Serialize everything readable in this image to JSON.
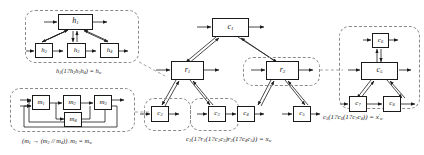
{
  "diagram": {
    "background_color": "#ffffff",
    "line_color": "#1a1a1a",
    "group_border_color": "#8a8a8a",
    "groups": [
      {
        "id": "group-h",
        "caption_html": "h<sub>1</sub>(1?h<sub>2</sub>h<sub>3</sub>h<sub>4</sub>) = h<sub>w</sub>",
        "caption_plain": "h1(1?h2h3h4) = hw"
      },
      {
        "id": "group-m",
        "caption_html": "(m<sub>1</sub> &#8594; (m<sub>2</sub> // m<sub>4</sub>))<sub>+</sub>m<sub>3</sub> = m<sub>w</sub>",
        "caption_plain": "(m1 -> (m2 // m4))+m3 = mw"
      },
      {
        "id": "group-center",
        "caption_html": "c<sub>1</sub>(1?r<sub>1</sub>(1?c<sub>2</sub>c<sub>3</sub>)r<sub>2</sub>(1?c<sub>4</sub>c<sub>5</sub>)) = x<sub>w</sub>",
        "caption_plain": "c1(1?r1(1?c2c3)r2(1?c4c5)) = xw"
      },
      {
        "id": "group-right",
        "caption_html": "c<sub>5</sub>(1?c<sub>6</sub>(1?c<sub>7</sub>c<sub>8</sub>)) = x<sup>&#8242;</sup><sub>w</sub>",
        "caption_plain": "c5(1?c6(1?c7c8)) = x'w"
      }
    ],
    "nodes": [
      {
        "id": "h1",
        "label_html": "h<sub>1</sub>",
        "label_plain": "h1",
        "group": "group-h"
      },
      {
        "id": "h2",
        "label_html": "h<sub>2</sub>",
        "label_plain": "h2",
        "group": "group-h"
      },
      {
        "id": "h3",
        "label_html": "h<sub>3</sub>",
        "label_plain": "h3",
        "group": "group-h"
      },
      {
        "id": "h4",
        "label_html": "h<sub>4</sub>",
        "label_plain": "h4",
        "group": "group-h"
      },
      {
        "id": "m1",
        "label_html": "m<sub>1</sub>",
        "label_plain": "m1",
        "group": "group-m"
      },
      {
        "id": "m2",
        "label_html": "m<sub>2</sub>",
        "label_plain": "m2",
        "group": "group-m"
      },
      {
        "id": "m3",
        "label_html": "m<sub>3</sub>",
        "label_plain": "m3",
        "group": "group-m"
      },
      {
        "id": "m4",
        "label_html": "m<sub>4</sub>",
        "label_plain": "m4",
        "group": "group-m"
      },
      {
        "id": "c1",
        "label_html": "c<sub>1</sub>",
        "label_plain": "c1",
        "group": "group-center"
      },
      {
        "id": "r1",
        "label_html": "r<sub>1</sub>",
        "label_plain": "r1",
        "group": "group-center"
      },
      {
        "id": "r2",
        "label_html": "r<sub>2</sub>",
        "label_plain": "r2",
        "group": "group-center"
      },
      {
        "id": "c2",
        "label_html": "c<sub>2</sub>",
        "label_plain": "c2",
        "group": "group-center"
      },
      {
        "id": "c3",
        "label_html": "c<sub>3</sub>",
        "label_plain": "c3",
        "group": "group-center"
      },
      {
        "id": "c4",
        "label_html": "c<sub>4</sub>",
        "label_plain": "c4",
        "group": "group-center"
      },
      {
        "id": "c5",
        "label_html": "c<sub>5</sub>",
        "label_plain": "c5",
        "group": "group-center"
      },
      {
        "id": "c5r",
        "label_html": "c<sub>5</sub>",
        "label_plain": "c5",
        "group": "group-right"
      },
      {
        "id": "c6",
        "label_html": "c<sub>6</sub>",
        "label_plain": "c6",
        "group": "group-right"
      },
      {
        "id": "c7",
        "label_html": "c<sub>7</sub>",
        "label_plain": "c7",
        "group": "group-right"
      },
      {
        "id": "c8",
        "label_html": "c<sub>8</sub>",
        "label_plain": "c8",
        "group": "group-right"
      }
    ]
  }
}
